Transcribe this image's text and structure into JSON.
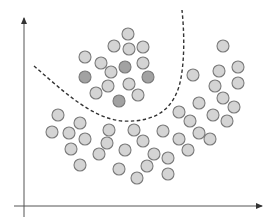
{
  "diagram": {
    "colors": {
      "background": "#ffffff",
      "axis": "#555555",
      "boundary": "#333333",
      "dot_light_fill": "#d4d4d4",
      "dot_dark_fill": "#a2a2a2",
      "dot_stroke": "#7a7a7a"
    },
    "axes": {
      "x_axis": {
        "x1": 14,
        "y1": 206,
        "x2": 262,
        "y2": 206,
        "arrow": "right"
      },
      "y_axis": {
        "x1": 24,
        "y1": 217,
        "x2": 24,
        "y2": 18,
        "arrow": "up"
      }
    },
    "boundary_path": "M34,66 C60,88 90,118 122,121 C160,123 176,105 181,78 C185,55 184,30 182,10",
    "dot_radius": 6,
    "clusters": [
      {
        "name": "inside-boundary-cluster",
        "dots": [
          {
            "x": 128,
            "y": 34,
            "shade": "light"
          },
          {
            "x": 114,
            "y": 46,
            "shade": "light"
          },
          {
            "x": 129,
            "y": 49,
            "shade": "light"
          },
          {
            "x": 143,
            "y": 47,
            "shade": "light"
          },
          {
            "x": 85,
            "y": 57,
            "shade": "light"
          },
          {
            "x": 101,
            "y": 63,
            "shade": "light"
          },
          {
            "x": 125,
            "y": 67,
            "shade": "dark"
          },
          {
            "x": 143,
            "y": 63,
            "shade": "light"
          },
          {
            "x": 111,
            "y": 72,
            "shade": "light"
          },
          {
            "x": 85,
            "y": 77,
            "shade": "dark"
          },
          {
            "x": 148,
            "y": 77,
            "shade": "dark"
          },
          {
            "x": 129,
            "y": 84,
            "shade": "light"
          },
          {
            "x": 108,
            "y": 86,
            "shade": "light"
          },
          {
            "x": 96,
            "y": 93,
            "shade": "light"
          },
          {
            "x": 138,
            "y": 95,
            "shade": "light"
          },
          {
            "x": 119,
            "y": 101,
            "shade": "dark"
          }
        ]
      },
      {
        "name": "outside-boundary-cluster",
        "dots": [
          {
            "x": 223,
            "y": 46,
            "shade": "light"
          },
          {
            "x": 238,
            "y": 67,
            "shade": "light"
          },
          {
            "x": 219,
            "y": 71,
            "shade": "light"
          },
          {
            "x": 193,
            "y": 75,
            "shade": "light"
          },
          {
            "x": 215,
            "y": 86,
            "shade": "light"
          },
          {
            "x": 238,
            "y": 83,
            "shade": "light"
          },
          {
            "x": 223,
            "y": 98,
            "shade": "light"
          },
          {
            "x": 199,
            "y": 103,
            "shade": "light"
          },
          {
            "x": 234,
            "y": 107,
            "shade": "light"
          },
          {
            "x": 179,
            "y": 112,
            "shade": "light"
          },
          {
            "x": 190,
            "y": 121,
            "shade": "light"
          },
          {
            "x": 213,
            "y": 115,
            "shade": "light"
          },
          {
            "x": 227,
            "y": 121,
            "shade": "light"
          },
          {
            "x": 163,
            "y": 131,
            "shade": "light"
          },
          {
            "x": 199,
            "y": 133,
            "shade": "light"
          },
          {
            "x": 143,
            "y": 141,
            "shade": "light"
          },
          {
            "x": 179,
            "y": 139,
            "shade": "light"
          },
          {
            "x": 210,
            "y": 139,
            "shade": "light"
          },
          {
            "x": 188,
            "y": 150,
            "shade": "light"
          },
          {
            "x": 154,
            "y": 154,
            "shade": "light"
          },
          {
            "x": 168,
            "y": 158,
            "shade": "light"
          },
          {
            "x": 147,
            "y": 166,
            "shade": "light"
          },
          {
            "x": 168,
            "y": 174,
            "shade": "light"
          },
          {
            "x": 137,
            "y": 178,
            "shade": "light"
          },
          {
            "x": 58,
            "y": 115,
            "shade": "light"
          },
          {
            "x": 80,
            "y": 123,
            "shade": "light"
          },
          {
            "x": 52,
            "y": 132,
            "shade": "light"
          },
          {
            "x": 69,
            "y": 133,
            "shade": "light"
          },
          {
            "x": 109,
            "y": 130,
            "shade": "light"
          },
          {
            "x": 134,
            "y": 130,
            "shade": "light"
          },
          {
            "x": 85,
            "y": 139,
            "shade": "light"
          },
          {
            "x": 107,
            "y": 143,
            "shade": "light"
          },
          {
            "x": 71,
            "y": 149,
            "shade": "light"
          },
          {
            "x": 125,
            "y": 150,
            "shade": "light"
          },
          {
            "x": 99,
            "y": 154,
            "shade": "light"
          },
          {
            "x": 80,
            "y": 165,
            "shade": "light"
          },
          {
            "x": 119,
            "y": 169,
            "shade": "light"
          }
        ]
      }
    ]
  }
}
